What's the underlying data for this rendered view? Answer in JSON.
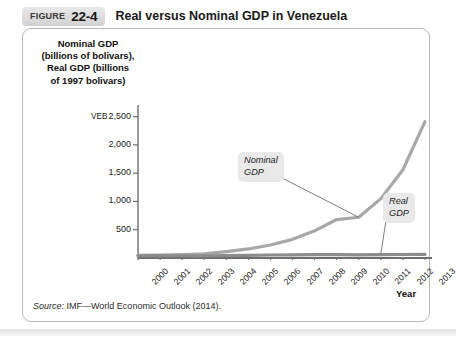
{
  "figure": {
    "label": "FIGURE",
    "number": "22-4",
    "title": "Real versus Nominal GDP in Venezuela"
  },
  "source": {
    "lead": "Source:",
    "text": " IMF—World Economic Outlook (2014)."
  },
  "callouts": {
    "nominal": "Nominal\nGDP",
    "real": "Real\nGDP"
  },
  "chart_data": {
    "type": "line",
    "title": "Real versus Nominal GDP in Venezuela",
    "ylabel": "Nominal GDP (billions of bolivars), Real GDP (billions of 1997 bolivars)",
    "ylabel_lines": [
      "Nominal GDP",
      "(billions of bolivars),",
      "Real GDP (billions",
      "of 1997 bolivars)"
    ],
    "xlabel": "Year",
    "currency_prefix": "VEB",
    "categories": [
      "2000",
      "2001",
      "2002",
      "2003",
      "2004",
      "2005",
      "2006",
      "2007",
      "2008",
      "2009",
      "2010",
      "2011",
      "2012",
      "2013"
    ],
    "yticks": [
      500,
      1000,
      1500,
      2000,
      2500
    ],
    "ytick_labels": [
      "500",
      "1,000",
      "1,500",
      "2,000",
      "2,500"
    ],
    "ylim": [
      0,
      2670
    ],
    "grid": false,
    "legend_position": "inline-callouts",
    "series": [
      {
        "name": "Nominal GDP",
        "color": "#a8a8a8",
        "values": [
          48,
          52,
          58,
          72,
          112,
          160,
          230,
          330,
          480,
          680,
          720,
          1050,
          1560,
          2410
        ]
      },
      {
        "name": "Real GDP",
        "color": "#8c8c8c",
        "values": [
          42,
          43,
          40,
          37,
          44,
          48,
          53,
          57,
          60,
          58,
          56,
          59,
          62,
          63
        ]
      }
    ]
  }
}
